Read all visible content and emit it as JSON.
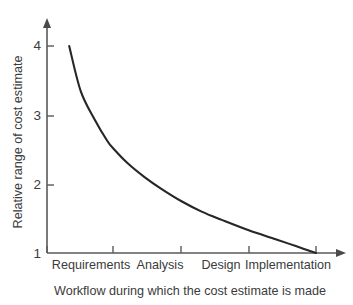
{
  "chart_data": {
    "type": "line",
    "title": "",
    "xlabel": "Workflow during which the cost estimate is made",
    "ylabel": "Relative range of cost estimate",
    "categories": [
      "Requirements",
      "Analysis",
      "Design",
      "Implementation"
    ],
    "x_tick_labels": [
      "",
      "",
      "",
      "",
      ""
    ],
    "y_tick_labels": [
      "1",
      "2",
      "3",
      "4"
    ],
    "ylim": [
      1,
      4
    ],
    "xlim": [
      0,
      4
    ],
    "grid": false,
    "legend": false,
    "series": [
      {
        "name": "Relative range of cost estimate",
        "x": [
          0.33,
          0.5,
          0.7,
          0.9,
          1.0,
          1.2,
          1.45,
          1.7,
          2.0,
          2.3,
          2.6,
          3.0,
          3.4,
          3.7,
          4.0
        ],
        "values": [
          4.0,
          3.35,
          2.95,
          2.62,
          2.5,
          2.3,
          2.1,
          1.93,
          1.75,
          1.6,
          1.48,
          1.33,
          1.2,
          1.1,
          1.0
        ]
      }
    ],
    "annotations": [],
    "colors": {
      "curve": "#262626",
      "axis": "#5a5a5a",
      "text": "#3b3b3b",
      "background": "#ffffff"
    }
  },
  "y_ticks": [
    {
      "label": "4",
      "y": 46
    },
    {
      "label": "3",
      "y": 116
    },
    {
      "label": "2",
      "y": 185
    },
    {
      "label": "1",
      "y": 253
    }
  ],
  "x_categories": [
    {
      "label": "Requirements",
      "x": 91
    },
    {
      "label": "Analysis",
      "x": 158
    },
    {
      "label": "Design",
      "x": 218
    },
    {
      "label": "Implementation",
      "x": 285
    }
  ],
  "axis_labels": {
    "y": "Relative range of cost estimate",
    "x": "Workflow during which the cost estimate is made"
  }
}
